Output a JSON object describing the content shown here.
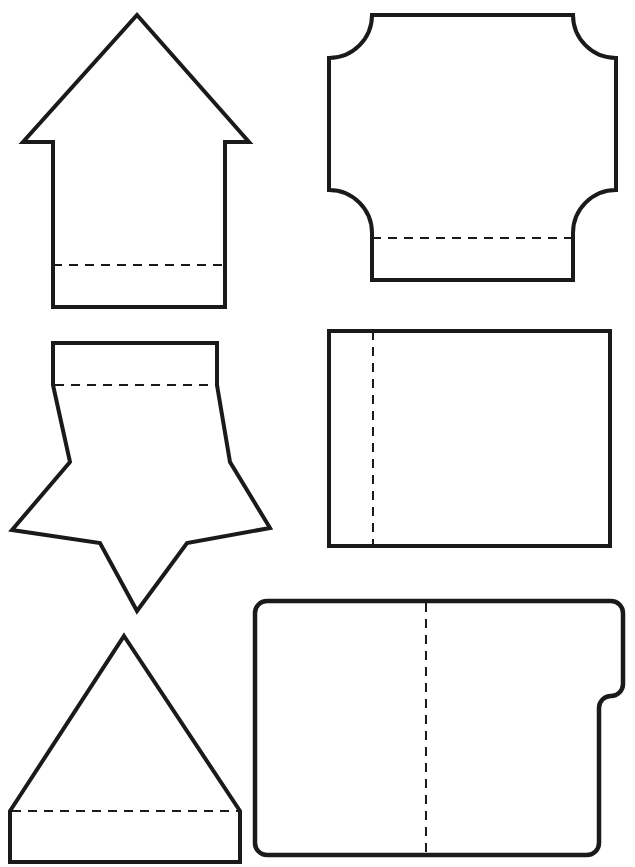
{
  "page": {
    "background_color": "#ffffff",
    "stroke_color": "#1a1a1a",
    "fold_line_color": "#1a1a1a",
    "width": 635,
    "height": 867,
    "shape_count": 6,
    "layout": "2 columns x 3 rows"
  },
  "shapes": [
    {
      "id": "shape-arrow-up",
      "name": "Up Arrow",
      "column": "left",
      "row": 1,
      "outline": "M137,15 L249,142 L225,142 L225,307 L53,307 L53,142 L23,142 Z",
      "fold_line": "M53,265 L225,265",
      "fold_type": "horizontal-dashed",
      "bounds": {
        "x": 21,
        "y": 13,
        "width": 230,
        "height": 296
      }
    },
    {
      "id": "shape-concave-square",
      "name": "Square with Concave Corners",
      "column": "right",
      "row": 1,
      "outline": "M370,15 L573,15 A43,43 0 0 0 616,58 L616,190 A43,43 0 0 0 573,233 L573,280 L372,280 L372,233 A43,43 0 0 0 329,190 L329,58 A43,43 0 0 0 372,15 Z",
      "fold_line": "M372,238 L573,238",
      "fold_type": "horizontal-dashed",
      "bounds": {
        "x": 327,
        "y": 13,
        "width": 291,
        "height": 269
      }
    },
    {
      "id": "shape-star-with-tab",
      "name": "Five-Point Star with Rectangular Tab",
      "column": "left",
      "row": 2,
      "outline": "M53,343 L217,343 L217,385 L230,462 L270,528 L187,543 L137,611 L100,543 L12,530 L70,462 L53,385 Z",
      "fold_line": "M55,385 L216,385",
      "fold_type": "horizontal-dashed",
      "bounds": {
        "x": 10,
        "y": 341,
        "width": 262,
        "height": 272
      }
    },
    {
      "id": "shape-rectangle-fold",
      "name": "Rectangle with Vertical Fold",
      "column": "right",
      "row": 2,
      "outline": "M329,331 L610,331 L610,546 L329,546 Z",
      "fold_line": "M373,331 L373,546",
      "fold_type": "vertical-dashed",
      "bounds": {
        "x": 327,
        "y": 329,
        "width": 285,
        "height": 219
      }
    },
    {
      "id": "shape-triangle-with-tab",
      "name": "Triangle with Rectangular Tab",
      "column": "left",
      "row": 3,
      "outline": "M124,636 L240,811 L240,862 L10,862 L10,811 Z",
      "fold_line": "M12,811 L238,811",
      "fold_type": "horizontal-dashed",
      "bounds": {
        "x": 8,
        "y": 634,
        "width": 234,
        "height": 230
      }
    },
    {
      "id": "shape-notched-rounded-rect",
      "name": "Rounded Rectangle with Side Notch",
      "column": "right",
      "row": 3,
      "outline": "M267,601 L611,601 A12,12 0 0 1 623,613 L623,684 A12,12 0 0 1 611,696 L611,696 A12,12 0 0 0 599,708 L599,843 A12,12 0 0 1 587,855 L267,855 A12,12 0 0 1 255,843 L255,613 A12,12 0 0 1 267,601 Z",
      "fold_line": "M426,603 L426,853",
      "fold_type": "vertical-dashed",
      "bounds": {
        "x": 253,
        "y": 599,
        "width": 372,
        "height": 258
      }
    }
  ]
}
